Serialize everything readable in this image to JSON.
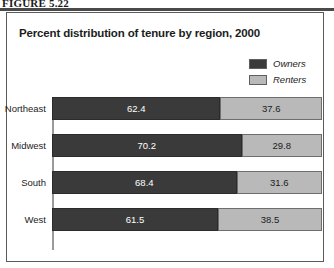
{
  "figure": {
    "caption": "FIGURE 5.22"
  },
  "chart_data": {
    "type": "bar",
    "subtype": "stacked-horizontal-100",
    "title": "Percent distribution of tenure by region, 2000",
    "xlabel": "",
    "ylabel": "",
    "xlim": [
      0,
      100
    ],
    "grid": false,
    "legend_position": "top-right",
    "categories": [
      "Northeast",
      "Midwest",
      "South",
      "West"
    ],
    "series": [
      {
        "name": "Owners",
        "color": "#3a3a3a",
        "values": [
          62.4,
          70.2,
          68.4,
          61.5
        ],
        "labels": [
          "62.4",
          "70.2",
          "68.4",
          "61.5"
        ]
      },
      {
        "name": "Renters",
        "color": "#b9b9b9",
        "values": [
          37.6,
          29.8,
          31.6,
          38.5
        ],
        "labels": [
          "37.6",
          "29.8",
          "31.6",
          "38.5"
        ]
      }
    ]
  },
  "legend": {
    "items": [
      {
        "label": "Owners",
        "color": "#3a3a3a"
      },
      {
        "label": "Renters",
        "color": "#b9b9b9"
      }
    ]
  }
}
